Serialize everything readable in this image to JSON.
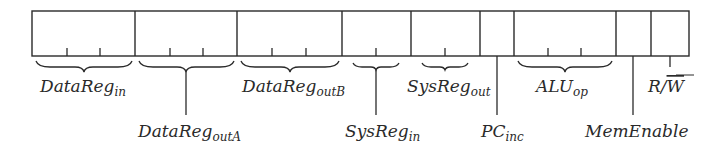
{
  "diagram": {
    "type": "instruction-word-field-layout",
    "stroke_color": "#2a2a2a",
    "background": "#ffffff",
    "fields": [
      {
        "id": "datareg-in",
        "base": "DataReg",
        "sub": "in",
        "bits": 3
      },
      {
        "id": "datareg-outA",
        "base": "DataReg",
        "sub": "outA",
        "bits": 3
      },
      {
        "id": "datareg-outB",
        "base": "DataReg",
        "sub": "outB",
        "bits": 3
      },
      {
        "id": "sysreg-in",
        "base": "SysReg",
        "sub": "in",
        "bits": 2
      },
      {
        "id": "sysreg-out",
        "base": "SysReg",
        "sub": "out",
        "bits": 2
      },
      {
        "id": "pc-inc",
        "base": "PC",
        "sub": "inc",
        "bits": 1
      },
      {
        "id": "alu-op",
        "base": "ALU",
        "sub": "op",
        "bits": 3
      },
      {
        "id": "mem-enable",
        "base": "MemEnable",
        "sub": "",
        "bits": 1
      },
      {
        "id": "read-write",
        "base": "R/",
        "overline": "W",
        "sub": "",
        "bits": 1
      }
    ]
  },
  "labels": {
    "datareg_in": {
      "base": "DataReg",
      "sub": "in"
    },
    "datareg_outA": {
      "base": "DataReg",
      "sub": "outA"
    },
    "datareg_outB": {
      "base": "DataReg",
      "sub": "outB"
    },
    "sysreg_in": {
      "base": "SysReg",
      "sub": "in"
    },
    "sysreg_out": {
      "base": "SysReg",
      "sub": "out"
    },
    "pc_inc": {
      "base": "PC",
      "sub": "inc"
    },
    "alu_op": {
      "base": "ALU",
      "sub": "op"
    },
    "mem_enable": {
      "base": "MemEnable"
    },
    "read_write": {
      "base": "R/",
      "overline": "W"
    }
  }
}
